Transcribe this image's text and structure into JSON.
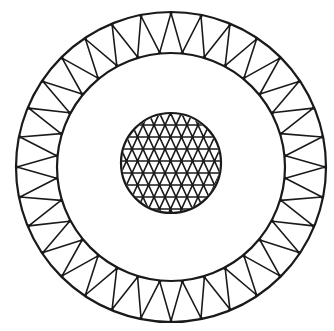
{
  "figure": {
    "stroke_color": "#1a1a1a",
    "background": "#ffffff",
    "outer_ring": {
      "center": [
        171,
        167
      ],
      "outer_radius": 155,
      "inner_radius": 114,
      "node_count": 32
    },
    "inner_disc": {
      "center": [
        171,
        163
      ],
      "radius": 50,
      "cell_width": 11,
      "row_height": 12
    }
  }
}
